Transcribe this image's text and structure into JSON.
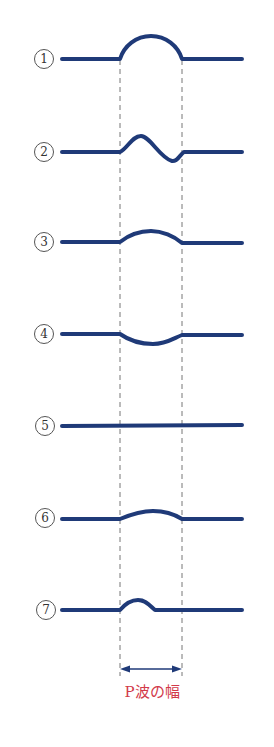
{
  "diagram": {
    "title": "P波の幅",
    "colors": {
      "trace": "#1f3a78",
      "guide": "#777777",
      "caption": "#d23a4a"
    },
    "guides": {
      "left_x": 120,
      "right_x": 182,
      "top_y": 60,
      "bottom_y": 676
    },
    "width_arrow": {
      "y": 669,
      "from_x": 120,
      "to_x": 182
    },
    "caption": "P波の幅",
    "waves": [
      {
        "label": "1",
        "baseline_y": 59,
        "shape": "tall-dome"
      },
      {
        "label": "2",
        "baseline_y": 152,
        "shape": "biphasic"
      },
      {
        "label": "3",
        "baseline_y": 242,
        "shape": "low-dome"
      },
      {
        "label": "4",
        "baseline_y": 334,
        "shape": "inverted-dome"
      },
      {
        "label": "5",
        "baseline_y": 426,
        "shape": "flat"
      },
      {
        "label": "6",
        "baseline_y": 518,
        "shape": "shallow-dome"
      },
      {
        "label": "7",
        "baseline_y": 609,
        "shape": "short-narrow-dome"
      }
    ]
  }
}
